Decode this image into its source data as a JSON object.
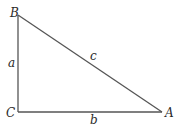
{
  "diagram": {
    "type": "right-triangle",
    "vertices": {
      "B": {
        "label": "B",
        "x": 18,
        "y": 15
      },
      "C": {
        "label": "C",
        "x": 18,
        "y": 112
      },
      "A": {
        "label": "A",
        "x": 162,
        "y": 112
      }
    },
    "sides": {
      "a": {
        "label": "a",
        "from": "B",
        "to": "C"
      },
      "b": {
        "label": "b",
        "from": "C",
        "to": "A"
      },
      "c": {
        "label": "c",
        "from": "B",
        "to": "A"
      }
    },
    "right_angle_at": "C",
    "colors": {
      "line": "#555555",
      "text": "#2a2a2a",
      "background": "#ffffff"
    }
  }
}
